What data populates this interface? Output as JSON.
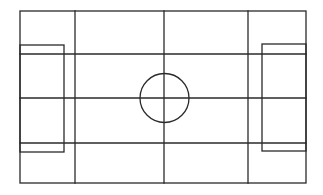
{
  "diagram": {
    "stroke_color": "#2a2a2a",
    "background_color": "#ffffff",
    "outer_boundary": {
      "x1": 20,
      "y1": 11,
      "x2": 306,
      "y2": 183
    },
    "vertical_lines": [
      75,
      164,
      248
    ],
    "horizontal_lines": [
      54,
      98,
      143
    ],
    "left_box": {
      "x1": 20,
      "y1": 45,
      "x2": 64,
      "y2": 152
    },
    "right_box": {
      "x1": 262,
      "y1": 44,
      "x2": 306,
      "y2": 151
    },
    "center_circle": {
      "cx": 164.5,
      "cy": 98,
      "r": 24.5
    }
  }
}
